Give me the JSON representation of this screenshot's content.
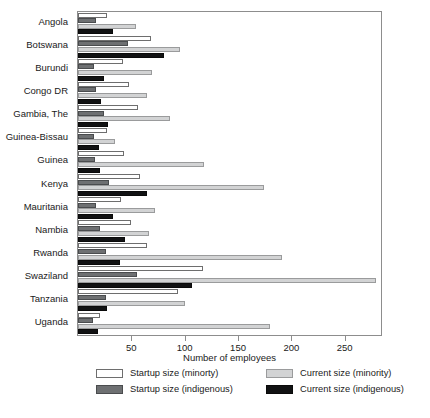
{
  "chart_data": {
    "type": "bar",
    "orientation": "horizontal",
    "title": "",
    "xlabel": "Number of employees",
    "ylabel": "",
    "xlim": [
      0,
      284
    ],
    "ylim": null,
    "grid": false,
    "legend_position": "below-axes",
    "xticks": [
      50,
      100,
      150,
      200,
      250
    ],
    "xtick_labels": [
      "50",
      "100",
      "150",
      "200",
      "250"
    ],
    "categories": [
      "Angola",
      "Botswana",
      "Burundi",
      "Congo DR",
      "Gambia, The",
      "Guinea-Bissau",
      "Guinea",
      "Kenya",
      "Mauritania",
      "Nambia",
      "Rwanda",
      "Swaziland",
      "Tanzania",
      "Uganda"
    ],
    "series": [
      {
        "name": "Startup size (minorty)",
        "key": "startup_minority",
        "color": "#ffffff",
        "edge_color": "#6e6e6e",
        "values": [
          27,
          68,
          42,
          48,
          56,
          27,
          43,
          58,
          40,
          50,
          65,
          117,
          94,
          21
        ]
      },
      {
        "name": "Startup size (indigenous)",
        "key": "startup_indigenous",
        "color": "#6e7072",
        "edge_color": "#4a4c4e",
        "values": [
          17,
          47,
          15,
          17,
          24,
          15,
          16,
          29,
          17,
          21,
          26,
          55,
          26,
          14
        ]
      },
      {
        "name": "Current size (minority)",
        "key": "current_minority",
        "color": "#d2d3d4",
        "edge_color": "#9a9b9c",
        "values": [
          54,
          96,
          69,
          65,
          86,
          35,
          118,
          174,
          72,
          67,
          191,
          279,
          100,
          180
        ]
      },
      {
        "name": "Current size (indigenous)",
        "key": "current_indigenous",
        "color": "#111213",
        "edge_color": "#0a0a0a",
        "values": [
          33,
          81,
          24,
          22,
          28,
          20,
          21,
          65,
          33,
          44,
          39,
          107,
          27,
          19
        ]
      }
    ]
  },
  "axis": {
    "x_title": "Number of employees"
  },
  "legend": {
    "items": [
      {
        "label": "Startup size (minorty)",
        "swatch": "sm",
        "column": "left",
        "row": 0
      },
      {
        "label": "Startup size (indigenous)",
        "swatch": "si",
        "column": "left",
        "row": 1
      },
      {
        "label": "Current size (minority)",
        "swatch": "cm",
        "column": "right",
        "row": 0
      },
      {
        "label": "Current size (indigenous)",
        "swatch": "ci",
        "column": "right",
        "row": 1
      }
    ]
  },
  "colors": {
    "startup_minority": "#ffffff",
    "startup_indigenous": "#6e7072",
    "current_minority": "#d2d3d4",
    "current_indigenous": "#111213",
    "frame": "#8d8d8d",
    "text": "#1a1a1a",
    "background": "#ffffff"
  }
}
